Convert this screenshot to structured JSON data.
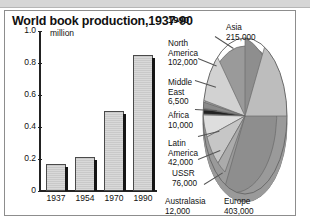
{
  "figure": {
    "title": "World book production,1937-90"
  },
  "chart_data": [
    {
      "type": "bar",
      "title": "World book production,1937-90",
      "xlabel": "",
      "ylabel": "million",
      "unit_label": "million",
      "categories": [
        "1937",
        "1954",
        "1970",
        "1990"
      ],
      "values": [
        0.17,
        0.21,
        0.5,
        0.85
      ],
      "ylim": [
        0,
        1.0
      ],
      "yticks": [
        "0",
        "0.2",
        "0.4",
        "0.6",
        "0.8",
        "1.0"
      ],
      "ytick_values": [
        0,
        0.2,
        0.4,
        0.6,
        0.8,
        1.0
      ],
      "grid": false,
      "legend": "none"
    },
    {
      "type": "pie",
      "title": "1990",
      "legend": "labels-with-leader-lines",
      "slices": [
        {
          "label": "Asia",
          "value": "215,000",
          "number": 215000,
          "color": "#b9b9b9"
        },
        {
          "label": "North\nAmerica",
          "value": "102,000",
          "number": 102000,
          "color": "#cfcfcf"
        },
        {
          "label": "Middle\nEast",
          "value": "6,500",
          "number": 6500,
          "color": "#8a8a8a"
        },
        {
          "label": "Africa",
          "value": "10,000",
          "number": 10000,
          "color": "#2b2b2b"
        },
        {
          "label": "Latin\nAmerica",
          "value": "42,000",
          "number": 42000,
          "color": "#dcdcdc"
        },
        {
          "label": "USSR",
          "value": "76,000",
          "number": 76000,
          "color": "#c4c4c4"
        },
        {
          "label": "Australasia",
          "value": "12,000",
          "number": 12000,
          "color": "#a8a8a8"
        },
        {
          "label": "Europe",
          "value": "403,000",
          "number": 403000,
          "color": "#8e8e8e"
        }
      ]
    }
  ],
  "pie_labels": {
    "year": "1990",
    "asia_name": "Asia",
    "asia_value": "215,000",
    "north_america_name": "North\nAmerica",
    "north_america_value": "102,000",
    "middle_east_name": "Middle\nEast",
    "middle_east_value": "6,500",
    "africa_name": "Africa",
    "africa_value": "10,000",
    "latin_america_name": "Latin\nAmerica",
    "latin_america_value": "42,000",
    "ussr_name": "USSR",
    "ussr_value": "76,000",
    "australasia_name": "Australasia",
    "australasia_value": "12,000",
    "europe_name": "Europe",
    "europe_value": "403,000"
  },
  "colors": {
    "panel_border": "#8d8d8d",
    "bar_fill": "#d2d2d2",
    "bar_edge": "#4a4a4a",
    "bar_shadow": "#151515",
    "axis": "#222222",
    "text": "#111111",
    "top_band": "#d6d6d6"
  }
}
